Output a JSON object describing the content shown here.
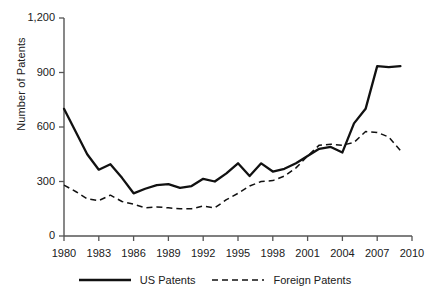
{
  "chart_data": {
    "type": "line",
    "title": "",
    "xlabel": "",
    "ylabel": "Number of Patents",
    "xlim": [
      1980,
      2010
    ],
    "ylim": [
      0,
      1200
    ],
    "ytick_labels": [
      "1,200",
      "900",
      "600",
      "300",
      "0"
    ],
    "yticks": [
      1200,
      900,
      600,
      300,
      0
    ],
    "xtick_labels": [
      "1980",
      "1983",
      "1986",
      "1989",
      "1992",
      "1995",
      "1998",
      "2001",
      "2004",
      "2007",
      "2010"
    ],
    "xticks": [
      1980,
      1983,
      1986,
      1989,
      1992,
      1995,
      1998,
      2001,
      2004,
      2007,
      2010
    ],
    "grid": false,
    "legend_position": "bottom",
    "x": [
      1980,
      1981,
      1982,
      1983,
      1984,
      1985,
      1986,
      1987,
      1988,
      1989,
      1990,
      1991,
      1992,
      1993,
      1994,
      1995,
      1996,
      1997,
      1998,
      1999,
      2000,
      2001,
      2002,
      2003,
      2004,
      2005,
      2006,
      2007,
      2008,
      2009
    ],
    "series": [
      {
        "name": "US Patents",
        "style": "solid",
        "color": "#111111",
        "values": [
          700,
          575,
          450,
          365,
          395,
          320,
          235,
          260,
          280,
          285,
          265,
          275,
          315,
          300,
          345,
          400,
          330,
          400,
          355,
          370,
          400,
          440,
          480,
          490,
          460,
          620,
          700,
          935,
          930,
          935
        ]
      },
      {
        "name": "Foreign Patents",
        "style": "dashed",
        "color": "#111111",
        "values": [
          280,
          245,
          205,
          195,
          225,
          190,
          175,
          155,
          160,
          155,
          150,
          150,
          165,
          155,
          200,
          235,
          275,
          300,
          305,
          330,
          375,
          440,
          500,
          505,
          500,
          515,
          575,
          570,
          545,
          470
        ]
      }
    ]
  },
  "legend": {
    "items": [
      {
        "label": "US Patents",
        "style": "solid"
      },
      {
        "label": "Foreign Patents",
        "style": "dashed"
      }
    ]
  }
}
